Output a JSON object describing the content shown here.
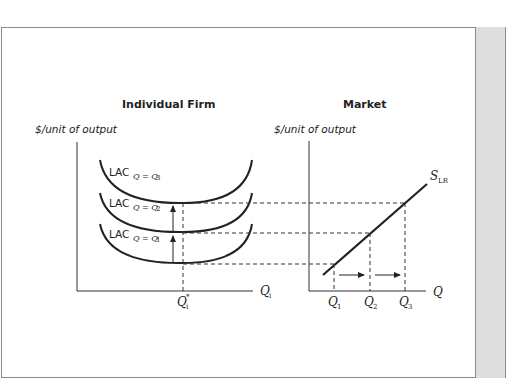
{
  "panels": {
    "left": {
      "title": "Individual Firm",
      "y_axis_label": "$/unit of output",
      "x_axis_label": "Q",
      "x_axis_sub": "i",
      "q_star_label": "Q",
      "q_star_sup": "*",
      "q_star_sub": "i",
      "curves": [
        {
          "label": "LAC",
          "sub": "Q = Q",
          "sub_index": "3"
        },
        {
          "label": "LAC",
          "sub": "Q = Q",
          "sub_index": "2"
        },
        {
          "label": "LAC",
          "sub": "Q = Q",
          "sub_index": "1"
        }
      ]
    },
    "right": {
      "title": "Market",
      "y_axis_label": "$/unit of output",
      "x_axis_label": "Q",
      "supply_label": "S",
      "supply_sub": "LR",
      "ticks": [
        {
          "label": "Q",
          "sub": "1"
        },
        {
          "label": "Q",
          "sub": "2"
        },
        {
          "label": "Q",
          "sub": "3"
        }
      ]
    }
  },
  "colors": {
    "line": "#222222",
    "frame": "#8a8a8a",
    "side_band": "#dedede"
  }
}
